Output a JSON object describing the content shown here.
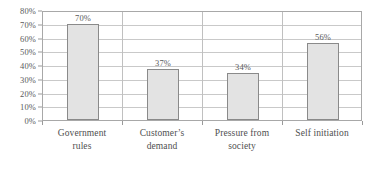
{
  "chart_data": {
    "type": "bar",
    "title": "",
    "subtitle": "",
    "xlabel": "",
    "ylabel": "",
    "categories": [
      "Government rules",
      "Customer’s demand",
      "Pressure from society",
      "Self initiation"
    ],
    "category_lines": [
      [
        "Government",
        "rules"
      ],
      [
        "Customer’s",
        "demand"
      ],
      [
        "Pressure from",
        "society"
      ],
      [
        "Self initiation"
      ]
    ],
    "values": [
      70,
      37,
      34,
      56
    ],
    "value_labels": [
      "70%",
      "37%",
      "34%",
      "56%"
    ],
    "ylim": [
      0,
      80
    ],
    "ytick_values": [
      0,
      10,
      20,
      30,
      40,
      50,
      60,
      70,
      80
    ],
    "ytick_labels": [
      "0%",
      "10%",
      "20%",
      "30%",
      "40%",
      "50%",
      "60%",
      "70%",
      "80%"
    ],
    "grid": true,
    "legend": null,
    "legend_position": "none",
    "colors": {
      "bar_fill": "#e3e3e3",
      "bar_border": "#8a8a8a",
      "gridline": "#c9c9c9",
      "plot_border": "#a8a8a8",
      "text": "#555555",
      "background": "#ffffff"
    }
  }
}
